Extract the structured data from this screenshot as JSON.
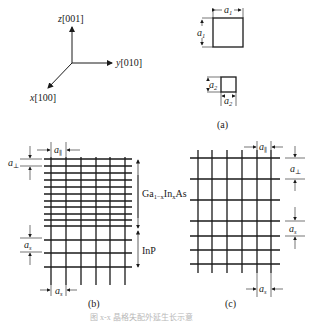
{
  "panel_a": {
    "caption": "(a)",
    "axes": {
      "z_label": "z",
      "z_index": "[001]",
      "y_label": "y",
      "y_index": "[010]",
      "x_label": "x",
      "x_index": "[100]"
    },
    "cell_large": {
      "width_label": "a",
      "width_sub": "1",
      "height_label": "a",
      "height_sub": "1"
    },
    "cell_small": {
      "width_label": "a",
      "width_sub": "2",
      "height_label": "a",
      "height_sub": "2"
    }
  },
  "panel_b": {
    "caption": "(b)",
    "top_label": "a",
    "top_sub": "∥",
    "left_top_label": "a",
    "left_top_sub": "⊥",
    "left_bottom_label": "a",
    "left_bottom_sub": "s",
    "bottom_label": "a",
    "bottom_sub": "s",
    "layer_top": {
      "name_pre": "Ga",
      "sub1": "1−x",
      "mid": "In",
      "sub2": "x",
      "post": "As"
    },
    "layer_bottom": "InP"
  },
  "panel_c": {
    "caption": "(c)",
    "top_label": "a",
    "top_sub": "∥",
    "right_top_label": "a",
    "right_top_sub": "⊥",
    "right_bottom_label": "a",
    "right_bottom_sub": "s",
    "bottom_label": "a",
    "bottom_sub": "s"
  },
  "figure_caption": "图 x-x 晶格失配外延生长示意"
}
